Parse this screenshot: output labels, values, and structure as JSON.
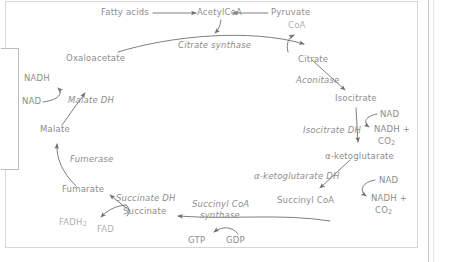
{
  "diagram": {
    "text_color": "#8d8d8d",
    "faint_color": "#b2b2b2",
    "arrow_color": "#6f6f6f",
    "panel_border_color": "#d6d6d6"
  },
  "metabolites": {
    "fatty_acids": "Fatty acids",
    "acetyl_coa": "AcetylCoA",
    "pyruvate": "Pyruvate",
    "coa": "CoA",
    "citrate": "Citrate",
    "isocitrate": "Isocitrate",
    "alpha_ketoglutarate": "α-ketoglutarate",
    "succinyl_coa": "Succinyl CoA",
    "succinate": "Succinate",
    "fumarate": "Fumarate",
    "malate": "Malate",
    "oxaloacetate": "Oxaloacetate"
  },
  "enzymes": {
    "citrate_synthase": "Citrate synthase",
    "aconitase": "Aconitase",
    "isocitrate_dh": "Isocitrate DH",
    "alpha_ketoglutarate_dh": "α-ketoglutarate DH",
    "succinyl_coa_synthase_line1": "Succinyl CoA",
    "succinyl_coa_synthase_line2": "synthase",
    "succinate_dh": "Succinate DH",
    "fumerase": "Fumerase",
    "malate_dh": "Malate DH"
  },
  "cofactors": {
    "nad_isocitrate": "NAD",
    "nadh_isocitrate_line1": "NADH +",
    "nadh_isocitrate_line2": "CO",
    "nadh_isocitrate_sub": "2",
    "nad_akg": "NAD",
    "nadh_akg_line1": "NADH +",
    "nadh_akg_line2": "CO",
    "nadh_akg_sub": "2",
    "gtp": "GTP",
    "gdp": "GDP",
    "fadh2": "FADH",
    "fadh2_sub": "2",
    "fad": "FAD",
    "nadh_malate": "NADH",
    "nad_malate": "NAD"
  }
}
